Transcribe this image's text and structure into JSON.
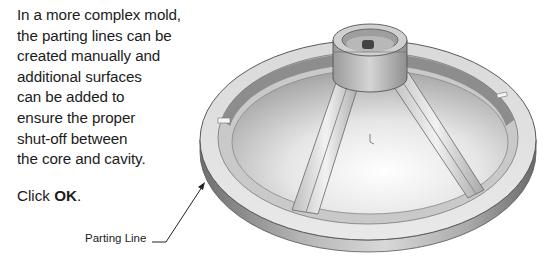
{
  "description": {
    "lines": [
      "In a more complex mold,",
      "the parting lines can be",
      "created manually and",
      "additional surfaces",
      "can be added to",
      "ensure the proper",
      "shut-off between",
      "the core and cavity."
    ]
  },
  "instruction": {
    "prefix": "Click ",
    "button": "OK",
    "suffix": "."
  },
  "figure": {
    "callout_label": "Parting Line"
  }
}
